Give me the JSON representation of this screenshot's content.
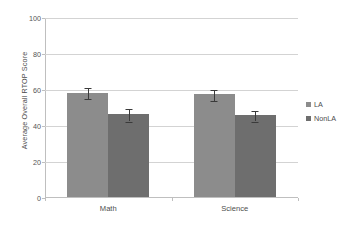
{
  "chart_data": {
    "type": "bar",
    "title": "",
    "xlabel": "",
    "ylabel": "Average Overall RTOP Score",
    "categories": [
      "Math",
      "Science"
    ],
    "ylim": [
      0,
      100
    ],
    "yticks": [
      0,
      20,
      40,
      60,
      80,
      100
    ],
    "ytick_labels": [
      "0",
      "20",
      "40",
      "60",
      "80",
      "100"
    ],
    "grid": true,
    "legend_position": "right",
    "series": [
      {
        "name": "LA",
        "color": "#8c8c8c",
        "values": [
          58,
          57
        ],
        "errors": [
          3,
          3
        ]
      },
      {
        "name": "NonLA",
        "color": "#6e6e6e",
        "values": [
          46,
          45.5
        ],
        "errors": [
          3.5,
          3
        ]
      }
    ]
  }
}
